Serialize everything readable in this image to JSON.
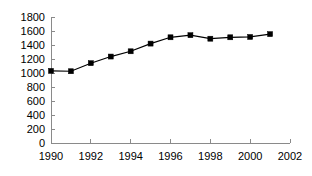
{
  "chart_data": {
    "type": "line",
    "title": "",
    "subtitle": "",
    "xlabel": "",
    "ylabel": "",
    "xlim": [
      1990,
      2002
    ],
    "ylim": [
      0,
      1800
    ],
    "x_tick_step": 2,
    "y_tick_step": 200,
    "grid": false,
    "legend": false,
    "legend_position": "none",
    "marker": "square",
    "marker_color": "#000000",
    "line_color": "#000000",
    "axis_color": "#8a8a8a",
    "x_ticks": [
      1990,
      1992,
      1994,
      1996,
      1998,
      2000,
      2002
    ],
    "x_tick_labels": [
      "1990",
      "1992",
      "1994",
      "1996",
      "1998",
      "2000",
      "2002"
    ],
    "y_ticks": [
      0,
      200,
      400,
      600,
      800,
      1000,
      1200,
      1400,
      1600,
      1800
    ],
    "y_tick_labels": [
      "0",
      "200",
      "400",
      "600",
      "800",
      "1000",
      "1200",
      "1400",
      "1600",
      "1800"
    ],
    "x": [
      1990,
      1991,
      1992,
      1993,
      1994,
      1995,
      1996,
      1997,
      1998,
      1999,
      2000,
      2001
    ],
    "values": [
      1030,
      1025,
      1140,
      1235,
      1310,
      1420,
      1510,
      1540,
      1490,
      1510,
      1515,
      1555
    ],
    "series": [
      {
        "name": "",
        "values": [
          1030,
          1025,
          1140,
          1235,
          1310,
          1420,
          1510,
          1540,
          1490,
          1510,
          1515,
          1555
        ]
      }
    ]
  }
}
